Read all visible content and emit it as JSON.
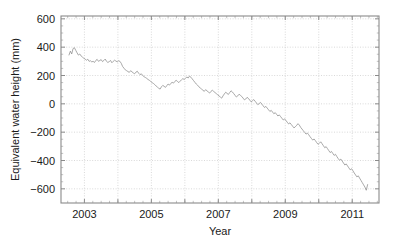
{
  "chart_data": {
    "type": "line",
    "title": "",
    "xlabel": "Year",
    "ylabel": "Equivalent water height (mm)",
    "xlim": [
      2002.3,
      2011.8
    ],
    "ylim": [
      -700,
      620
    ],
    "grid": true,
    "legend": null,
    "xticks": [
      2003,
      2005,
      2007,
      2009,
      2011
    ],
    "xtick_labels": [
      "2003",
      "2005",
      "2007",
      "2009",
      "2011"
    ],
    "xticks_minor": [
      2004,
      2006,
      2008,
      2010
    ],
    "yticks": [
      600,
      400,
      200,
      0,
      -200,
      -400,
      -600
    ],
    "ytick_labels": [
      "600",
      "400",
      "200",
      "0",
      "-200",
      "-400",
      "-600"
    ],
    "line_color": "#8c8c8c",
    "series": [
      {
        "name": "Equivalent water height",
        "x": [
          2002.54,
          2002.58,
          2002.62,
          2002.66,
          2002.7,
          2002.74,
          2002.78,
          2002.82,
          2002.86,
          2002.9,
          2002.94,
          2002.98,
          2003.02,
          2003.06,
          2003.1,
          2003.14,
          2003.18,
          2003.22,
          2003.26,
          2003.3,
          2003.34,
          2003.38,
          2003.42,
          2003.46,
          2003.5,
          2003.54,
          2003.58,
          2003.62,
          2003.66,
          2003.7,
          2003.74,
          2003.78,
          2003.82,
          2003.86,
          2003.9,
          2003.94,
          2003.98,
          2004.02,
          2004.06,
          2004.1,
          2004.14,
          2004.18,
          2004.22,
          2004.26,
          2004.3,
          2004.34,
          2004.38,
          2004.42,
          2004.46,
          2004.5,
          2004.54,
          2004.58,
          2004.62,
          2004.66,
          2004.7,
          2004.74,
          2004.78,
          2004.82,
          2004.86,
          2004.9,
          2004.94,
          2004.98,
          2005.02,
          2005.06,
          2005.1,
          2005.14,
          2005.18,
          2005.22,
          2005.26,
          2005.3,
          2005.34,
          2005.38,
          2005.42,
          2005.46,
          2005.5,
          2005.54,
          2005.58,
          2005.62,
          2005.66,
          2005.7,
          2005.74,
          2005.78,
          2005.82,
          2005.86,
          2005.9,
          2005.94,
          2005.98,
          2006.02,
          2006.06,
          2006.1,
          2006.14,
          2006.18,
          2006.22,
          2006.26,
          2006.3,
          2006.34,
          2006.38,
          2006.42,
          2006.46,
          2006.5,
          2006.54,
          2006.58,
          2006.62,
          2006.66,
          2006.7,
          2006.74,
          2006.78,
          2006.82,
          2006.86,
          2006.9,
          2006.94,
          2006.98,
          2007.02,
          2007.06,
          2007.1,
          2007.14,
          2007.18,
          2007.22,
          2007.26,
          2007.3,
          2007.34,
          2007.38,
          2007.42,
          2007.46,
          2007.5,
          2007.54,
          2007.58,
          2007.62,
          2007.66,
          2007.7,
          2007.74,
          2007.78,
          2007.82,
          2007.86,
          2007.9,
          2007.94,
          2007.98,
          2008.02,
          2008.06,
          2008.1,
          2008.14,
          2008.18,
          2008.22,
          2008.26,
          2008.3,
          2008.34,
          2008.38,
          2008.42,
          2008.46,
          2008.5,
          2008.54,
          2008.58,
          2008.62,
          2008.66,
          2008.7,
          2008.74,
          2008.78,
          2008.82,
          2008.86,
          2008.9,
          2008.94,
          2008.98,
          2009.02,
          2009.06,
          2009.1,
          2009.14,
          2009.18,
          2009.22,
          2009.26,
          2009.3,
          2009.34,
          2009.38,
          2009.42,
          2009.46,
          2009.5,
          2009.54,
          2009.58,
          2009.62,
          2009.66,
          2009.7,
          2009.74,
          2009.78,
          2009.82,
          2009.86,
          2009.9,
          2009.94,
          2009.98,
          2010.02,
          2010.06,
          2010.1,
          2010.14,
          2010.18,
          2010.22,
          2010.26,
          2010.3,
          2010.34,
          2010.38,
          2010.42,
          2010.46,
          2010.5,
          2010.54,
          2010.58,
          2010.62,
          2010.66,
          2010.7,
          2010.74,
          2010.78,
          2010.82,
          2010.86,
          2010.9,
          2010.94,
          2010.98,
          2011.02,
          2011.06,
          2011.1,
          2011.14,
          2011.18,
          2011.22,
          2011.26,
          2011.3,
          2011.34,
          2011.38,
          2011.42,
          2011.46
        ],
        "y": [
          345,
          372,
          352,
          390,
          396,
          378,
          360,
          344,
          352,
          338,
          330,
          322,
          316,
          308,
          315,
          300,
          304,
          296,
          300,
          292,
          306,
          314,
          300,
          306,
          312,
          298,
          306,
          316,
          300,
          292,
          298,
          306,
          290,
          300,
          308,
          302,
          296,
          304,
          300,
          286,
          264,
          252,
          240,
          234,
          228,
          222,
          234,
          226,
          218,
          212,
          224,
          230,
          216,
          206,
          212,
          200,
          192,
          186,
          180,
          172,
          166,
          158,
          150,
          144,
          136,
          126,
          118,
          110,
          104,
          120,
          130,
          124,
          116,
          128,
          140,
          132,
          144,
          152,
          146,
          158,
          166,
          158,
          150,
          160,
          170,
          178,
          172,
          180,
          190,
          182,
          196,
          188,
          176,
          164,
          152,
          140,
          132,
          120,
          112,
          104,
          96,
          88,
          100,
          92,
          84,
          76,
          88,
          96,
          88,
          80,
          72,
          64,
          56,
          48,
          40,
          56,
          70,
          82,
          74,
          66,
          80,
          92,
          84,
          72,
          60,
          48,
          56,
          68,
          60,
          52,
          40,
          28,
          34,
          46,
          38,
          26,
          14,
          22,
          30,
          18,
          6,
          -6,
          2,
          10,
          -2,
          -14,
          -26,
          -18,
          -30,
          -42,
          -54,
          -46,
          -58,
          -70,
          -62,
          -74,
          -86,
          -78,
          -90,
          -102,
          -114,
          -106,
          -118,
          -130,
          -142,
          -134,
          -146,
          -158,
          -170,
          -162,
          -152,
          -140,
          -150,
          -166,
          -178,
          -190,
          -202,
          -214,
          -206,
          -218,
          -232,
          -244,
          -256,
          -248,
          -260,
          -274,
          -286,
          -278,
          -268,
          -282,
          -296,
          -310,
          -302,
          -316,
          -330,
          -344,
          -336,
          -350,
          -364,
          -356,
          -372,
          -386,
          -398,
          -390,
          -404,
          -418,
          -432,
          -424,
          -438,
          -452,
          -466,
          -458,
          -472,
          -488,
          -502,
          -516,
          -508,
          -524,
          -540,
          -556,
          -572,
          -588,
          -610,
          -570
        ]
      }
    ]
  }
}
